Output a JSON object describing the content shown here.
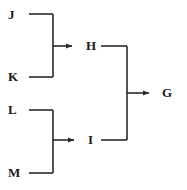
{
  "diagram": {
    "type": "flowchart-merge-tree",
    "background_color": "#ffffff",
    "line_color": "#2a2a2a",
    "text_color": "#1a1a1a",
    "nodes": [
      {
        "id": "J",
        "label": "J",
        "x": 8,
        "y": 8,
        "role": "input"
      },
      {
        "id": "K",
        "label": "K",
        "x": 8,
        "y": 70,
        "role": "input"
      },
      {
        "id": "H",
        "label": "H",
        "x": 86,
        "y": 39,
        "role": "intermediate"
      },
      {
        "id": "L",
        "label": "L",
        "x": 8,
        "y": 103,
        "role": "input"
      },
      {
        "id": "M",
        "label": "M",
        "x": 8,
        "y": 166,
        "role": "input"
      },
      {
        "id": "I",
        "label": "I",
        "x": 88,
        "y": 133,
        "role": "intermediate"
      },
      {
        "id": "G",
        "label": "G",
        "x": 162,
        "y": 86,
        "role": "output"
      }
    ],
    "edges": [
      {
        "from": "J",
        "to": "H",
        "arrow": true
      },
      {
        "from": "K",
        "to": "H",
        "arrow": true
      },
      {
        "from": "L",
        "to": "I",
        "arrow": true
      },
      {
        "from": "M",
        "to": "I",
        "arrow": true
      },
      {
        "from": "H",
        "to": "G",
        "arrow": true
      },
      {
        "from": "I",
        "to": "G",
        "arrow": true
      }
    ],
    "geometry": {
      "stroke_width": 1.6,
      "top_bracket": {
        "x_rail": 53,
        "y_top": 14,
        "y_bottom": 77,
        "x_start": 29,
        "y_branch": 46,
        "arrow_end": 78
      },
      "bottom_bracket": {
        "x_rail": 53,
        "y_top": 110,
        "y_bottom": 173,
        "x_start": 29,
        "y_branch": 140,
        "arrow_end": 80
      },
      "center_bracket": {
        "x_rail": 127,
        "y_top": 46,
        "y_bottom": 140,
        "x_start": 101,
        "y_branch": 93,
        "arrow_end": 155
      }
    }
  }
}
